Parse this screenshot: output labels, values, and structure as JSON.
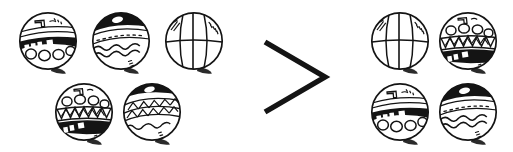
{
  "scene": {
    "title": "Quantity comparison: group of balls vs group of balls",
    "background_color": "#ffffff",
    "ink_color": "#141414",
    "shadow_color": "#2a2a2a",
    "width": 513,
    "height": 152
  },
  "comparison": {
    "operator_symbol": ">",
    "operator_name": "greater-than-sign",
    "left_count": 5,
    "right_count": 4,
    "statement": "5 > 4"
  },
  "left_group": {
    "name": "left-ball-group",
    "count": 5,
    "balls": [
      {
        "id": "left-ball-1",
        "pattern": "striped-band-with-circles",
        "cx": 48,
        "cy": 41,
        "r": 29
      },
      {
        "id": "left-ball-2",
        "pattern": "wavy-lines-dark-cap",
        "cx": 121,
        "cy": 41,
        "r": 29
      },
      {
        "id": "left-ball-3",
        "pattern": "globe-meridians",
        "cx": 194,
        "cy": 41,
        "r": 29
      },
      {
        "id": "left-ball-4",
        "pattern": "zigzag-band-dark-base",
        "cx": 84,
        "cy": 112,
        "r": 29
      },
      {
        "id": "left-ball-5",
        "pattern": "diagonal-lattice-dark-cap",
        "cx": 152,
        "cy": 112,
        "r": 29
      }
    ]
  },
  "right_group": {
    "name": "right-ball-group",
    "count": 4,
    "balls": [
      {
        "id": "right-ball-1",
        "pattern": "globe-meridians",
        "cx": 400,
        "cy": 41,
        "r": 29
      },
      {
        "id": "right-ball-2",
        "pattern": "zigzag-band-dark-base",
        "cx": 468,
        "cy": 41,
        "r": 29
      },
      {
        "id": "right-ball-3",
        "pattern": "striped-band-with-circles",
        "cx": 400,
        "cy": 112,
        "r": 29
      },
      {
        "id": "right-ball-4",
        "pattern": "wavy-lines-dark-cap",
        "cx": 468,
        "cy": 112,
        "r": 29
      }
    ]
  },
  "operator": {
    "name": "greater-than-symbol",
    "glyph": ">",
    "apex_x": 325,
    "top_y": 42,
    "bottom_y": 112
  }
}
